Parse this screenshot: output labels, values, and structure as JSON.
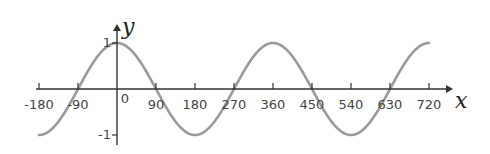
{
  "chart_data": {
    "type": "line",
    "title": "",
    "function": "y = cos(x)",
    "xlabel": "x",
    "ylabel": "y",
    "xlim": [
      -180,
      720
    ],
    "ylim": [
      -1,
      1
    ],
    "grid": false,
    "legend": null,
    "x_ticks": [
      -180,
      -90,
      0,
      90,
      180,
      270,
      360,
      450,
      540,
      630,
      720
    ],
    "x_tick_labels": [
      "-180",
      "-90",
      "0",
      "90",
      "180",
      "270",
      "360",
      "450",
      "540",
      "630",
      "720"
    ],
    "y_ticks": [
      1,
      -1
    ],
    "y_tick_labels": [
      "1",
      "-1"
    ],
    "series": [
      {
        "name": "cos x",
        "color": "#9a9a9a",
        "x": [
          -180,
          -90,
          0,
          90,
          180,
          270,
          360,
          450,
          540,
          630,
          720
        ],
        "values": [
          -1,
          0,
          1,
          0,
          -1,
          0,
          1,
          0,
          -1,
          0,
          1
        ]
      }
    ]
  },
  "colors": {
    "axis": "#333333",
    "curve": "#9a9a9a"
  }
}
